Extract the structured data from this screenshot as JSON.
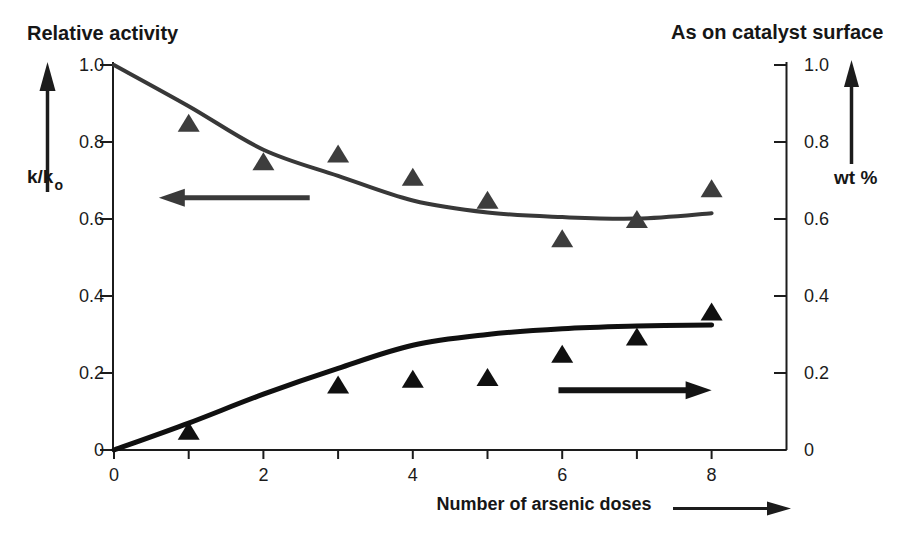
{
  "page": {
    "background": "#ffffff",
    "ink_color": "#1c1c1c"
  },
  "chart_data": {
    "type": "line",
    "grid": false,
    "legend": "none",
    "x_axis": {
      "label": "Number of arsenic doses",
      "range": [
        0,
        9
      ],
      "minor_ticks": [
        0,
        1,
        2,
        3,
        4,
        5,
        6,
        7,
        8
      ],
      "tick_labels": [
        {
          "value": 0,
          "text": "0"
        },
        {
          "value": 2,
          "text": "2"
        },
        {
          "value": 4,
          "text": "4"
        },
        {
          "value": 6,
          "text": "6"
        },
        {
          "value": 8,
          "text": "8"
        }
      ]
    },
    "left_axis": {
      "title": "Relative activity",
      "unit_main": "k/k",
      "unit_sub": "o",
      "range": [
        0,
        1.0
      ],
      "ticks": [
        {
          "value": 1.0,
          "text": "1.0"
        },
        {
          "value": 0.8,
          "text": "0.8"
        },
        {
          "value": 0.6,
          "text": "0.6"
        },
        {
          "value": 0.4,
          "text": "0.4"
        },
        {
          "value": 0.2,
          "text": "0.2"
        },
        {
          "value": 0,
          "text": "0"
        }
      ]
    },
    "right_axis": {
      "title": "As on catalyst surface",
      "unit": "wt %",
      "range": [
        0,
        1.0
      ],
      "ticks": [
        {
          "value": 1.0,
          "text": "1.0"
        },
        {
          "value": 0.8,
          "text": "0.8"
        },
        {
          "value": 0.6,
          "text": "0.6"
        },
        {
          "value": 0.4,
          "text": "0.4"
        },
        {
          "value": 0.2,
          "text": "0.2"
        },
        {
          "value": 0,
          "text": "0"
        }
      ]
    },
    "series": [
      {
        "name": "relative-activity-trend-curve",
        "axis": "left",
        "style": "curve",
        "color": "#383838",
        "stroke_width": 4,
        "points": [
          [
            0,
            1.0
          ],
          [
            1,
            0.893
          ],
          [
            2,
            0.78
          ],
          [
            3,
            0.712
          ],
          [
            4,
            0.648
          ],
          [
            5,
            0.617
          ],
          [
            6,
            0.605
          ],
          [
            7,
            0.601
          ],
          [
            8,
            0.615
          ]
        ]
      },
      {
        "name": "relative-activity-data-points",
        "axis": "left",
        "style": "triangle-markers",
        "color": "#3d3d3d",
        "points": [
          [
            1,
            0.85
          ],
          [
            2,
            0.75
          ],
          [
            3,
            0.77
          ],
          [
            4,
            0.71
          ],
          [
            5,
            0.65
          ],
          [
            6,
            0.55
          ],
          [
            7,
            0.6
          ],
          [
            8,
            0.68
          ]
        ]
      },
      {
        "name": "arsenic-on-surface-trend-curve",
        "axis": "right",
        "style": "curve",
        "color": "#101010",
        "stroke_width": 5,
        "points": [
          [
            0,
            0
          ],
          [
            1,
            0.07
          ],
          [
            2,
            0.145
          ],
          [
            3,
            0.212
          ],
          [
            4,
            0.272
          ],
          [
            5,
            0.3
          ],
          [
            6,
            0.315
          ],
          [
            7,
            0.322
          ],
          [
            8,
            0.325
          ]
        ]
      },
      {
        "name": "arsenic-on-surface-data-points",
        "axis": "right",
        "style": "triangle-markers",
        "color": "#101010",
        "points": [
          [
            1,
            0.05
          ],
          [
            3,
            0.17
          ],
          [
            4,
            0.185
          ],
          [
            5,
            0.19
          ],
          [
            6,
            0.25
          ],
          [
            7,
            0.295
          ],
          [
            8,
            0.36
          ]
        ]
      }
    ],
    "annotations": [
      {
        "name": "points-to-left-axis-arrow",
        "direction": "left",
        "x_tail": 2.62,
        "x_head": 0.6,
        "y": 0.655,
        "color": "#3a3a3a",
        "shaft_width": 5
      },
      {
        "name": "points-to-right-axis-arrow",
        "direction": "right",
        "x_tail": 5.95,
        "x_head": 8.0,
        "y": 0.155,
        "color": "#141414",
        "shaft_width": 6
      }
    ]
  }
}
